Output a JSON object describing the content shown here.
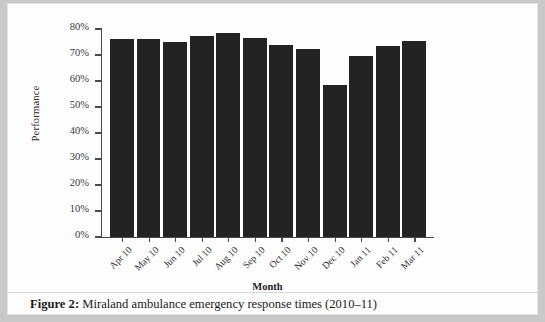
{
  "figure": {
    "caption_prefix": "Figure 2:",
    "caption_text": "Miraland ambulance emergency response times (2010–11)"
  },
  "chart_data": {
    "type": "bar",
    "title": "",
    "xlabel": "Month",
    "ylabel": "Performance",
    "categories": [
      "Apr 10",
      "May 10",
      "Jun 10",
      "Jul 10",
      "Aug 10",
      "Sep 10",
      "Oct 10",
      "Nov 10",
      "Dec 10",
      "Jan 11",
      "Feb 11",
      "Mar 11"
    ],
    "values": [
      76,
      76,
      75,
      77.5,
      78.5,
      76.5,
      74,
      72.5,
      58.5,
      69.5,
      73.5,
      75.5
    ],
    "ylim": [
      0,
      80
    ],
    "ytick_values": [
      0,
      10,
      20,
      30,
      40,
      50,
      60,
      70,
      80
    ],
    "ytick_labels": [
      "0%",
      "10%",
      "20%",
      "30%",
      "40%",
      "50%",
      "60%",
      "70%",
      "80%"
    ],
    "grid": false,
    "legend": false,
    "bar_color": "#232323",
    "axis_color": "#4a4a4a"
  }
}
